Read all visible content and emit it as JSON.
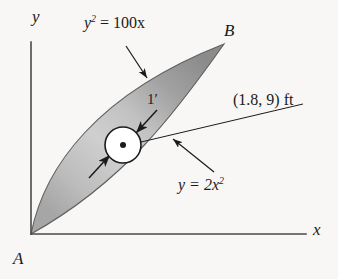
{
  "figure": {
    "background_color": "#f8f7f5",
    "ink_color": "#1b1b1b"
  },
  "axes": {
    "y_label": "y",
    "x_label": "x",
    "origin_label": "A",
    "y_axis": {
      "x": 31,
      "y_top": 42,
      "y_bottom": 234
    },
    "x_axis": {
      "y": 234,
      "x_left": 31,
      "x_right": 306
    }
  },
  "points": {
    "origin": {
      "label": "A",
      "x": 31,
      "y": 234
    },
    "upper": {
      "label": "B",
      "x": 224,
      "y": 44
    }
  },
  "curves": [
    {
      "name": "upper-left-curve",
      "label": "y",
      "label_exponent": "2",
      "label_rest": " = 100x",
      "equation_text": "y2 = 100x",
      "leader_from": {
        "x": 126,
        "y": 47
      },
      "leader_to": {
        "x": 147,
        "y": 78
      }
    },
    {
      "name": "lower-right-curve",
      "label": "y",
      "label_rest": " = 2x",
      "label_exponent": "2",
      "equation_text": "y = 2x2",
      "leader_from": {
        "x": 213,
        "y": 171
      },
      "leader_to": {
        "x": 172,
        "y": 138
      }
    }
  ],
  "hole": {
    "name": "circular-hole",
    "center": {
      "x": 123,
      "y": 145
    },
    "radius": 18,
    "center_dot_radius": 3,
    "fill": "#ffffff",
    "stroke": "#1b1b1b",
    "diameter_label": "1′",
    "centroid_coordinates": "(1.8, 9) ft",
    "leader_from": {
      "x": 303,
      "y": 104
    },
    "leader_to": {
      "x": 123,
      "y": 146
    }
  },
  "shading": {
    "light": "#cfcfcf",
    "mid": "#b4b4b4",
    "dark": "#8d8d8d",
    "edge": "#6e6e6e"
  },
  "labels": {
    "curve_upper": "y² = 100x",
    "curve_lower": "y = 2x²",
    "coordinate": "(1.8, 9) ft",
    "dimension": "1′",
    "axis_y": "y",
    "axis_x": "x",
    "point_a": "A",
    "point_b": "B"
  },
  "text_parts": {
    "curve_upper_base": "y",
    "curve_upper_sup": "2",
    "curve_upper_tail": " = 100x",
    "curve_lower_head": "y = 2x",
    "curve_lower_sup": "2",
    "coord_text": "(1.8, 9) ft",
    "dim_text": "1′"
  }
}
